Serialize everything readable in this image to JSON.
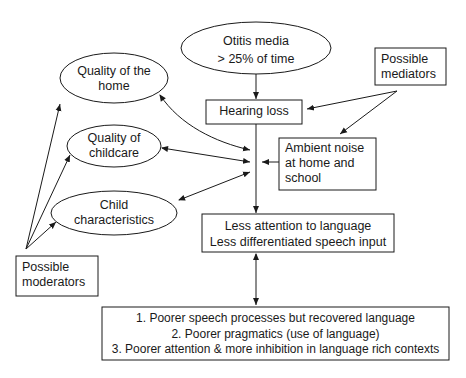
{
  "nodes": {
    "otitis_media": {
      "lines": [
        "Otitis media",
        "> 25% of time"
      ]
    },
    "hearing_loss": {
      "lines": [
        "Hearing loss"
      ]
    },
    "possible_mediators": {
      "lines": [
        "Possible",
        "mediators"
      ]
    },
    "quality_home": {
      "lines": [
        "Quality of the",
        "home"
      ]
    },
    "quality_childcare": {
      "lines": [
        "Quality of",
        "childcare"
      ]
    },
    "child_characteristics": {
      "lines": [
        "Child",
        "characteristics"
      ]
    },
    "ambient_noise": {
      "lines": [
        "Ambient noise",
        "at home and",
        "school"
      ]
    },
    "less_attention": {
      "lines": [
        "Less attention to language",
        "Less differentiated speech input"
      ]
    },
    "possible_moderators": {
      "lines": [
        "Possible",
        "moderators"
      ]
    },
    "outcomes": {
      "lines": [
        "1. Poorer speech processes but recovered language",
        "2. Poorer pragmatics (use of language)",
        "3. Poorer attention & more inhibition in language rich contexts"
      ]
    }
  },
  "colors": {
    "stroke": "#1a1a1a",
    "background": "#ffffff"
  }
}
